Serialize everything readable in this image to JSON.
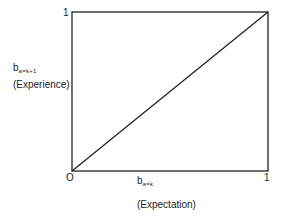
{
  "diagram": {
    "type": "line",
    "title": "",
    "y_axis": {
      "variable": "b",
      "subscript": "a=k+1",
      "label": "(Experience)",
      "top_tick": "1"
    },
    "x_axis": {
      "variable": "b",
      "subscript": "a=k",
      "label": "(Expectation)",
      "right_tick": "1"
    },
    "origin_label": "O",
    "line": {
      "from": [
        0,
        0
      ],
      "to": [
        1,
        1
      ],
      "description": "45-degree diagonal from origin to (1,1)"
    },
    "colors": {
      "stroke": "#222222",
      "background": "#ffffff"
    }
  }
}
